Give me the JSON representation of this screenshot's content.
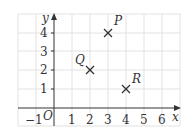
{
  "diagram": {
    "type": "coordinate-grid",
    "axes": {
      "x_label": "x",
      "y_label": "y",
      "origin_label": "O",
      "x_ticks": [
        "−1",
        "1",
        "2",
        "3",
        "4",
        "5",
        "6"
      ],
      "y_ticks": [
        "1",
        "2",
        "3",
        "4"
      ],
      "x_range": [
        -1,
        6.5
      ],
      "y_range": [
        -1,
        5
      ]
    },
    "points": [
      {
        "label": "P",
        "x": 3,
        "y": 4
      },
      {
        "label": "Q",
        "x": 2,
        "y": 2
      },
      {
        "label": "R",
        "x": 4,
        "y": 1
      }
    ],
    "colors": {
      "grid": "#e2e2e2",
      "axis": "#333333",
      "marker": "#333333"
    }
  }
}
